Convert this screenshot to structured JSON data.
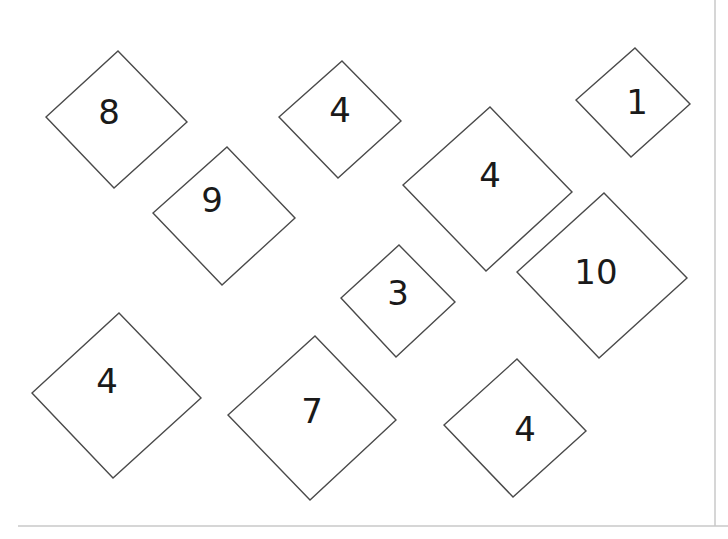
{
  "worksheet": {
    "style": {
      "stroke_color": "#4a4a4a",
      "label_color": "#1a1a1a",
      "background": "#ffffff",
      "border_color": "#c8c8c8"
    },
    "diamonds": [
      {
        "id": "d1",
        "label": "8",
        "points": "118,51 187,122 114,188 46,117",
        "label_x": 109,
        "label_y": 112
      },
      {
        "id": "d2",
        "label": "4",
        "points": "342,61 401,121 338,178 279,117",
        "label_x": 340,
        "label_y": 110
      },
      {
        "id": "d3",
        "label": "1",
        "points": "635,48 690,104 631,157 576,100",
        "label_x": 637,
        "label_y": 102
      },
      {
        "id": "d4",
        "label": "9",
        "points": "227,147 295,218 222,285 153,213",
        "label_x": 212,
        "label_y": 200
      },
      {
        "id": "d5",
        "label": "4",
        "points": "490,107 572,192 486,271 403,185",
        "label_x": 490,
        "label_y": 175
      },
      {
        "id": "d6",
        "label": "3",
        "points": "399,245 455,302 396,357 341,298",
        "label_x": 398,
        "label_y": 293
      },
      {
        "id": "d7",
        "label": "10",
        "points": "604,193 687,278 599,358 517,272",
        "label_x": 596,
        "label_y": 272
      },
      {
        "id": "d8",
        "label": "4",
        "points": "119,313 201,398 113,478 32,393",
        "label_x": 107,
        "label_y": 381
      },
      {
        "id": "d9",
        "label": "7",
        "points": "315,336 396,420 310,500 228,415",
        "label_x": 312,
        "label_y": 411
      },
      {
        "id": "d10",
        "label": "4",
        "points": "517,359 586,431 513,497 444,425",
        "label_x": 525,
        "label_y": 429
      }
    ]
  }
}
